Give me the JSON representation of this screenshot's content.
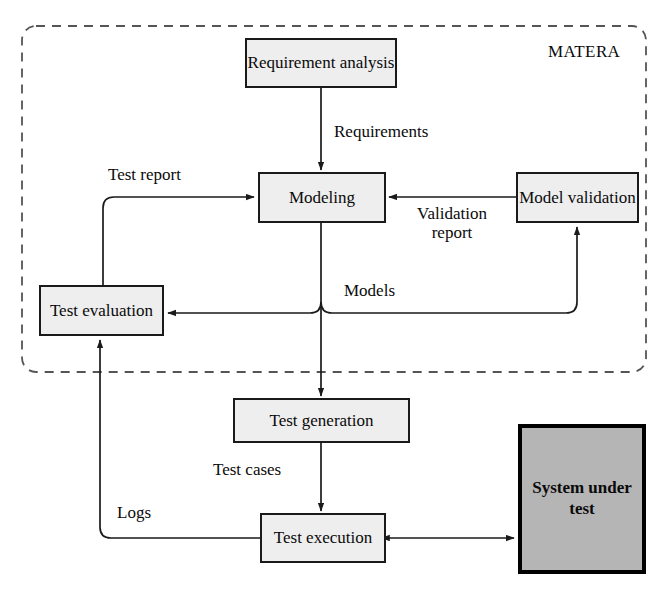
{
  "diagram": {
    "group": {
      "label": "MATERA",
      "border_style": "dashed",
      "border_color": "#555555"
    },
    "colors": {
      "node_fill": "#eeeeee",
      "node_border": "#1a1a1a",
      "sut_fill": "#b5b5b5",
      "sut_border": "#000000",
      "edge": "#1a1a1a",
      "text": "#0a0a0a",
      "background": "#ffffff"
    },
    "nodes": [
      {
        "id": "requirement-analysis",
        "label": "Requirement\nanalysis",
        "x": 245,
        "y": 38,
        "w": 152,
        "h": 50,
        "inside_group": true
      },
      {
        "id": "modeling",
        "label": "Modeling",
        "x": 258,
        "y": 172,
        "w": 128,
        "h": 51,
        "inside_group": true
      },
      {
        "id": "model-validation",
        "label": "Model\nvalidation",
        "x": 516,
        "y": 172,
        "w": 123,
        "h": 51,
        "inside_group": true
      },
      {
        "id": "test-evaluation",
        "label": "Test\nevaluation",
        "x": 39,
        "y": 285,
        "w": 125,
        "h": 51,
        "inside_group": true
      },
      {
        "id": "test-generation",
        "label": "Test generation",
        "x": 233,
        "y": 398,
        "w": 177,
        "h": 45,
        "inside_group": false
      },
      {
        "id": "test-execution",
        "label": "Test\nexecution",
        "x": 260,
        "y": 513,
        "w": 126,
        "h": 50,
        "inside_group": false
      },
      {
        "id": "system-under-test",
        "label": "System\nunder\ntest",
        "x": 518,
        "y": 424,
        "w": 128,
        "h": 150,
        "inside_group": false
      }
    ],
    "edge_labels": [
      {
        "id": "requirements",
        "label": "Requirements",
        "x": 334,
        "y": 122
      },
      {
        "id": "test-report",
        "label": "Test report",
        "x": 108,
        "y": 165
      },
      {
        "id": "validation-report",
        "label": "Validation\nreport",
        "x": 404,
        "y": 204
      },
      {
        "id": "models",
        "label": "Models",
        "x": 344,
        "y": 281
      },
      {
        "id": "test-cases",
        "label": "Test cases",
        "x": 213,
        "y": 460
      },
      {
        "id": "logs",
        "label": "Logs",
        "x": 117,
        "y": 503
      }
    ],
    "edges": [
      {
        "id": "requirement-analysis-to-modeling",
        "from": "requirement-analysis",
        "to": "modeling",
        "label": "Requirements",
        "arrow": "single"
      },
      {
        "id": "model-validation-to-modeling",
        "from": "model-validation",
        "to": "modeling",
        "label": "Validation report",
        "arrow": "single"
      },
      {
        "id": "modeling-to-test-evaluation",
        "from": "modeling",
        "to": "test-evaluation",
        "label": "Models",
        "arrow": "single"
      },
      {
        "id": "modeling-to-model-validation",
        "from": "modeling",
        "to": "model-validation",
        "label": "Models",
        "arrow": "single"
      },
      {
        "id": "modeling-to-test-generation",
        "from": "modeling",
        "to": "test-generation",
        "label": "",
        "arrow": "single"
      },
      {
        "id": "test-evaluation-to-modeling",
        "from": "test-evaluation",
        "to": "modeling",
        "label": "Test report",
        "arrow": "single"
      },
      {
        "id": "test-generation-to-test-execution",
        "from": "test-generation",
        "to": "test-execution",
        "label": "Test cases",
        "arrow": "single"
      },
      {
        "id": "test-execution-to-test-evaluation",
        "from": "test-execution",
        "to": "test-evaluation",
        "label": "Logs",
        "arrow": "single"
      },
      {
        "id": "test-execution-to-system-under-test",
        "from": "test-execution",
        "to": "system-under-test",
        "label": "",
        "arrow": "double"
      }
    ]
  }
}
